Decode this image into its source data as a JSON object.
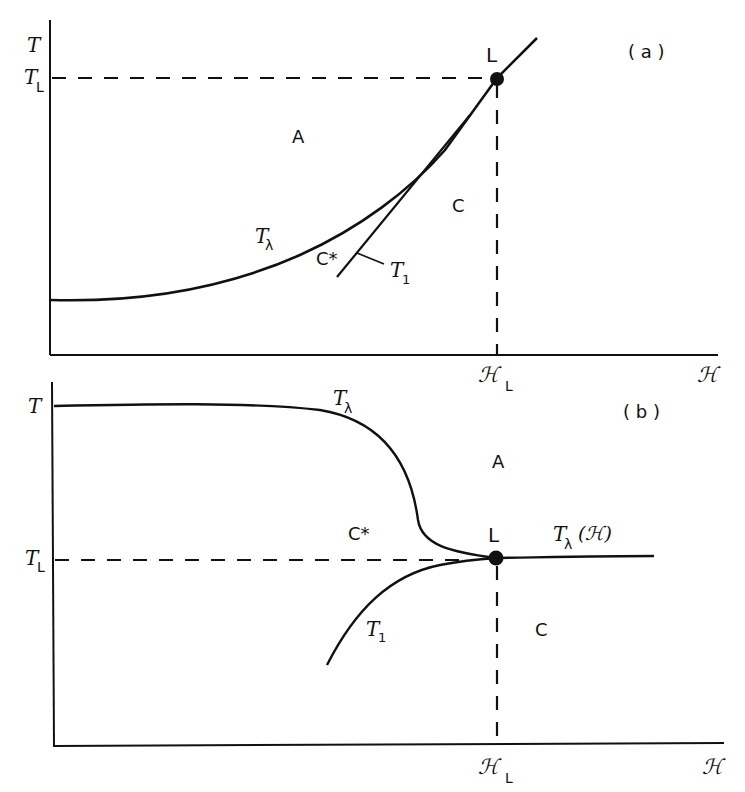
{
  "figure": {
    "colors": {
      "ink": "#111111",
      "background": "#ffffff"
    }
  },
  "panel_a": {
    "tag": "( a )",
    "y_axis_label": "T",
    "y_tick_label": "T",
    "y_tick_sub": "L",
    "x_axis_label": "ℋ",
    "x_tick_label": "ℋ",
    "x_tick_sub": "L",
    "point_label": "L",
    "regions": {
      "A": "A",
      "C": "C",
      "C_star": "C*"
    },
    "curves": {
      "t_lambda": {
        "label": "T",
        "sub": "λ"
      },
      "t_1": {
        "label": "T",
        "sub": "1"
      }
    }
  },
  "panel_b": {
    "tag": "( b )",
    "y_axis_label": "T",
    "y_tick_label": "T",
    "y_tick_sub": "L",
    "x_axis_label": "ℋ",
    "x_tick_label": "ℋ",
    "x_tick_sub": "L",
    "point_label": "L",
    "regions": {
      "A": "A",
      "C": "C",
      "C_star": "C*"
    },
    "curves": {
      "t_lambda": {
        "label": "T",
        "sub": "λ"
      },
      "t_lambda_h": {
        "label": "T",
        "sub": "λ",
        "arg": "(ℋ)"
      },
      "t_1": {
        "label": "T",
        "sub": "1"
      }
    }
  }
}
